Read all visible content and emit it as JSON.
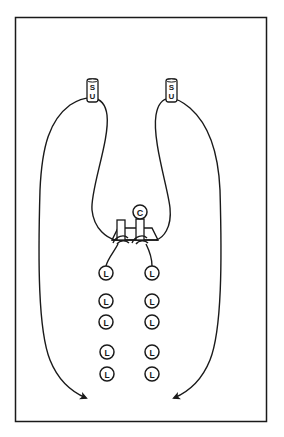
{
  "diagram": {
    "type": "drill-diagram",
    "stroke_color": "#1a1a1a",
    "background": "#ffffff",
    "setup_markers": [
      {
        "id": "su-left",
        "line1": "S",
        "line2": "U"
      },
      {
        "id": "su-right",
        "line1": "S",
        "line2": "U"
      }
    ],
    "coach": {
      "label": "C"
    },
    "players_left": [
      {
        "label": "L"
      },
      {
        "label": "L"
      },
      {
        "label": "L"
      },
      {
        "label": "L"
      },
      {
        "label": "L"
      }
    ],
    "players_right": [
      {
        "label": "L"
      },
      {
        "label": "L"
      },
      {
        "label": "L"
      },
      {
        "label": "L"
      },
      {
        "label": "L"
      }
    ]
  }
}
